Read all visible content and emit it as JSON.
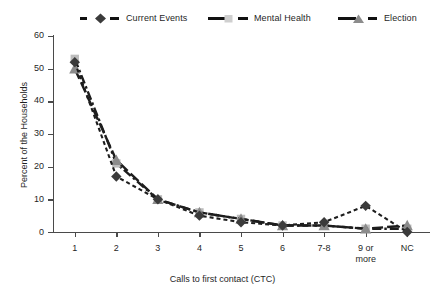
{
  "legend": {
    "position": "top",
    "items": [
      {
        "label": "Current Events",
        "marker": "diamond",
        "color": "#3b3b3b",
        "line": "dashed"
      },
      {
        "label": "Mental Health",
        "marker": "square",
        "color": "#bdbdbd",
        "line": "dash-dot"
      },
      {
        "label": "Election",
        "marker": "triangle",
        "color": "#8c8c8c",
        "line": "long-dash"
      }
    ]
  },
  "axes": {
    "y_title": "Percent of the Households",
    "x_title": "Calls to first contact (CTC)",
    "y_ticks": [
      "0",
      "10",
      "20",
      "30",
      "40",
      "50",
      "60"
    ],
    "x_ticks": [
      "1",
      "2",
      "3",
      "4",
      "5",
      "6",
      "7-8",
      "9 or\nmore",
      "NC"
    ]
  },
  "chart_data": {
    "type": "line",
    "title": "",
    "xlabel": "Calls to first contact (CTC)",
    "ylabel": "Percent of the Households",
    "categories": [
      "1",
      "2",
      "3",
      "4",
      "5",
      "6",
      "7-8",
      "9 or more",
      "NC"
    ],
    "ylim": [
      0,
      60
    ],
    "yticks": [
      0,
      10,
      20,
      30,
      40,
      50,
      60
    ],
    "grid": false,
    "legend_position": "top",
    "series": [
      {
        "name": "Current Events",
        "color": "#3b3b3b",
        "marker": "diamond",
        "linestyle": "dashed",
        "values": [
          52,
          17,
          10,
          5,
          3,
          2,
          3,
          8,
          0
        ]
      },
      {
        "name": "Mental Health",
        "color": "#bdbdbd",
        "marker": "square",
        "linestyle": "dash-dot",
        "values": [
          53,
          21,
          10,
          6,
          4,
          2,
          2,
          1,
          1
        ]
      },
      {
        "name": "Election",
        "color": "#8c8c8c",
        "marker": "triangle",
        "linestyle": "long-dash",
        "values": [
          50,
          22,
          10,
          6,
          4,
          2,
          2,
          1,
          2
        ]
      }
    ]
  }
}
